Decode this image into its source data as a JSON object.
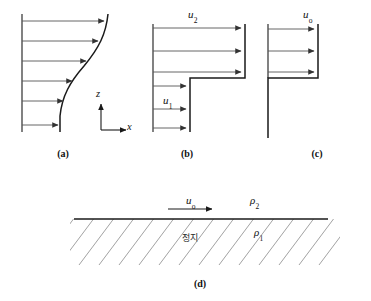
{
  "figure": {
    "background_color": "#ffffff",
    "line_color": "#1a1a1a",
    "arrow_color": "#555555",
    "hatch_color": "#8a8a8a"
  },
  "panels": [
    {
      "id": "a",
      "caption": "(a)",
      "profile_type": "continuous-shear-layer",
      "axes": {
        "vertical_label": "z",
        "horizontal_label": "x"
      },
      "velocity_label": "",
      "arrow_count": 6,
      "arrow_lengths_px": [
        94,
        88,
        73,
        52,
        34,
        28
      ]
    },
    {
      "id": "b",
      "caption": "(b)",
      "profile_type": "vortex-sheet-two-stream",
      "upper_velocity_label": "u",
      "upper_velocity_subscript": "2",
      "lower_velocity_label": "u",
      "lower_velocity_subscript": "1",
      "upper_arrow_count": 3,
      "lower_arrow_count": 3,
      "upper_arrow_length_px": 86,
      "lower_arrow_length_px": 40
    },
    {
      "id": "c",
      "caption": "(c)",
      "profile_type": "vortex-sheet-single-stream",
      "velocity_label": "u",
      "velocity_subscript": "o",
      "arrow_count": 3,
      "arrow_length_px": 45
    },
    {
      "id": "d",
      "caption": "(d)",
      "profile_type": "stratified-interface",
      "velocity_label": "u",
      "velocity_subscript": "o",
      "upper_density_label": "ρ",
      "upper_density_subscript": "2",
      "lower_density_label": "ρ",
      "lower_density_subscript": "1",
      "region_label": "정지",
      "hatched": true
    }
  ]
}
